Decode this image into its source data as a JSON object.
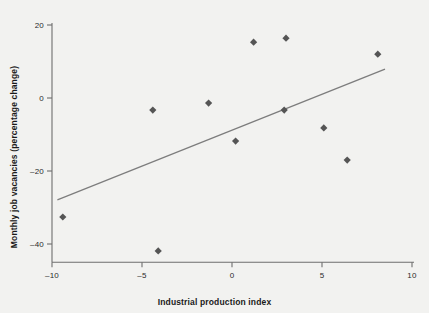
{
  "chart_data": {
    "type": "scatter",
    "title": "",
    "xlabel": "Industrial production index",
    "ylabel": "Monthly job vacancies (percentage change)",
    "xlim": [
      -10,
      10
    ],
    "ylim": [
      -45,
      20
    ],
    "xticks": [
      -10,
      -5,
      0,
      5,
      10
    ],
    "xtick_labels": [
      "–10",
      "–5",
      "0",
      "5",
      "10"
    ],
    "yticks": [
      20,
      0,
      -20,
      -40
    ],
    "ytick_labels": [
      "20",
      "0",
      "–20",
      "–40"
    ],
    "grid": false,
    "legend": null,
    "marker": "diamond",
    "marker_color": "#555555",
    "trendline_color": "#7d7d7d",
    "axis_color": "#6e6e6e",
    "background_color": "#f2f2f0",
    "points": [
      {
        "x": -9.4,
        "y": -32.6
      },
      {
        "x": -4.4,
        "y": -3.3
      },
      {
        "x": -4.1,
        "y": -41.9
      },
      {
        "x": -1.3,
        "y": -1.4
      },
      {
        "x": 0.2,
        "y": -11.8
      },
      {
        "x": 1.2,
        "y": 15.3
      },
      {
        "x": 2.9,
        "y": -3.3
      },
      {
        "x": 3.0,
        "y": 16.4
      },
      {
        "x": 5.1,
        "y": -8.2
      },
      {
        "x": 6.4,
        "y": -17.0
      },
      {
        "x": 8.1,
        "y": 12.0
      }
    ],
    "trendline": {
      "x1": -9.7,
      "y1": -27.9,
      "x2": 8.5,
      "y2": 7.9
    }
  }
}
